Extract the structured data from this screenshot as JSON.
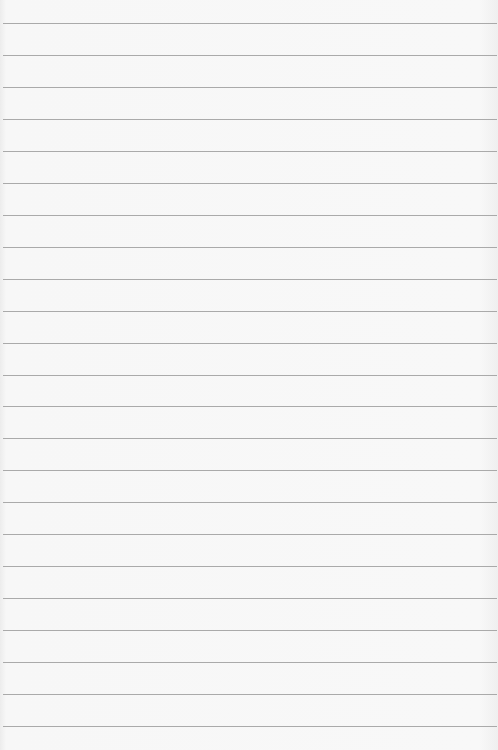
{
  "paper": {
    "description": "Blank ruled notebook paper",
    "background_color": "#f7f7f7",
    "line_color": "#9c9c9c",
    "line_count": 23,
    "first_line_y": 23,
    "line_spacing": 31.95,
    "line_x_start": 3,
    "line_width": 494,
    "lines_y": [
      23,
      55,
      87,
      119,
      151,
      183,
      215,
      247,
      279,
      311,
      343,
      375,
      406,
      438,
      470,
      502,
      534,
      566,
      598,
      630,
      662,
      694,
      726
    ]
  }
}
